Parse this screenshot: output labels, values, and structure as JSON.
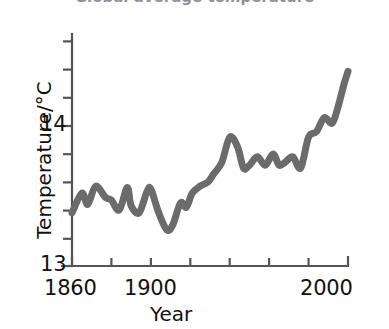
{
  "figure": {
    "title_remnant": "Global average temperature",
    "background": "#ffffff",
    "line_color": "#6b6b6b",
    "axis_color": "#555555",
    "text_color": "#111111"
  },
  "axes": {
    "y_title": "Temperature/°C",
    "x_title": "Year",
    "y_ticks": [
      {
        "label": "13",
        "value": 13
      },
      {
        "label": "14",
        "value": 14
      }
    ],
    "x_ticks": [
      {
        "label": "1860",
        "value": 1860
      },
      {
        "label": "1900",
        "value": 1900
      },
      {
        "label": "2000",
        "value": 2000
      }
    ]
  },
  "chart_data": {
    "type": "line",
    "title": "Global average temperature",
    "xlabel": "Year",
    "ylabel": "Temperature/°C",
    "xlim": [
      1860,
      2000
    ],
    "ylim": [
      13,
      14.6
    ],
    "xtick_values": [
      1860,
      1880,
      1900,
      1920,
      1940,
      1960,
      1980,
      2000
    ],
    "xtick_labels": [
      "1860",
      "",
      "1900",
      "",
      "",
      "",
      "",
      "2000"
    ],
    "ytick_values": [
      13,
      14
    ],
    "ytick_labels": [
      "13",
      "14"
    ],
    "y_minor_tick_values": [
      13.2,
      13.4,
      13.6,
      13.8,
      14.2,
      14.4,
      14.6
    ],
    "grid": false,
    "legend": null,
    "series": [
      {
        "name": "Global average temperature",
        "color": "#6b6b6b",
        "x": [
          1860,
          1865,
          1868,
          1872,
          1877,
          1880,
          1884,
          1888,
          1890,
          1894,
          1898,
          1900,
          1904,
          1908,
          1911,
          1915,
          1918,
          1921,
          1925,
          1929,
          1932,
          1936,
          1940,
          1944,
          1947,
          1950,
          1954,
          1958,
          1962,
          1965,
          1968,
          1972,
          1976,
          1980,
          1984,
          1988,
          1992,
          1995,
          1998,
          2000
        ],
        "y": [
          13.38,
          13.52,
          13.44,
          13.57,
          13.49,
          13.47,
          13.4,
          13.56,
          13.43,
          13.38,
          13.53,
          13.55,
          13.38,
          13.26,
          13.29,
          13.45,
          13.42,
          13.52,
          13.57,
          13.6,
          13.66,
          13.74,
          13.92,
          13.85,
          13.7,
          13.72,
          13.78,
          13.72,
          13.8,
          13.72,
          13.74,
          13.78,
          13.7,
          13.92,
          13.96,
          14.06,
          14.02,
          14.14,
          14.3,
          14.39
        ]
      }
    ]
  }
}
